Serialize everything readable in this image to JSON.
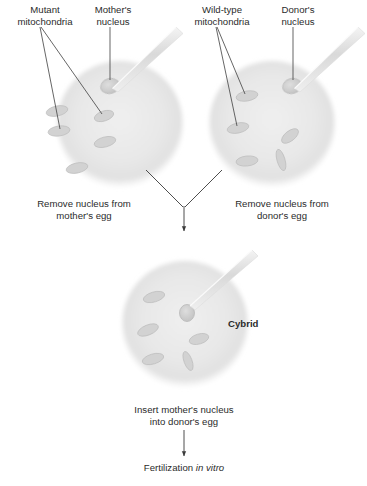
{
  "figure": {
    "background_color": "#ffffff",
    "ink_color": "#2b2b2b",
    "egg_fill": "#e9e9e9",
    "egg_edge": "#dcdcdc",
    "mitochondria_fill": "#cfcfcf",
    "mitochondria_edge": "#b4b4b4",
    "pipette_color": "#e4e4e4"
  },
  "labels": {
    "mutant_mitochondria": "Mutant\nmitochondria",
    "mutant_mitochondria_line1": "Mutant",
    "mutant_mitochondria_line2": "mitochondria",
    "mothers_nucleus_line1": "Mother's",
    "mothers_nucleus_line2": "nucleus",
    "wildtype_mitochondria_line1": "Wild-type",
    "wildtype_mitochondria_line2": "mitochondria",
    "donors_nucleus_line1": "Donor's",
    "donors_nucleus_line2": "nucleus",
    "cybrid": "Cybrid"
  },
  "captions": {
    "remove_mother_line1": "Remove nucleus from",
    "remove_mother_line2": "mother's egg",
    "remove_donor_line1": "Remove nucleus from",
    "remove_donor_line2": "donor's egg",
    "insert_line1": "Insert mother's nucleus",
    "insert_line2": "into donor's egg",
    "fertilization_prefix": "Fertilization ",
    "fertilization_italic": "in vitro"
  },
  "cells": [
    {
      "id": "mothers-egg",
      "name": "Mother's egg",
      "center": [
        120,
        124
      ],
      "radius": 63,
      "nucleus": {
        "cx": 110,
        "cy": 86,
        "rx": 9,
        "ry": 7,
        "label": "Mother's nucleus",
        "extracted_by_pipette": true
      },
      "mitochondria_type": "mutant",
      "mitochondria": [
        {
          "cx": 59,
          "cy": 131,
          "rx": 11,
          "ry": 5,
          "rot": -8
        },
        {
          "cx": 57,
          "cy": 111,
          "rx": 11,
          "ry": 5,
          "rot": -12
        },
        {
          "cx": 104,
          "cy": 116,
          "rx": 10,
          "ry": 5,
          "rot": -18
        },
        {
          "cx": 105,
          "cy": 142,
          "rx": 11,
          "ry": 5,
          "rot": -14
        },
        {
          "cx": 77,
          "cy": 168,
          "rx": 11,
          "ry": 5,
          "rot": -12
        }
      ]
    },
    {
      "id": "donors-egg",
      "name": "Donor's egg",
      "center": [
        272,
        124
      ],
      "radius": 63,
      "nucleus": {
        "cx": 292,
        "cy": 86,
        "rx": 9,
        "ry": 7,
        "label": "Donor's nucleus",
        "extracted_by_pipette": true
      },
      "mitochondria_type": "wild-type",
      "mitochondria": [
        {
          "cx": 247,
          "cy": 96,
          "rx": 11,
          "ry": 5,
          "rot": -10
        },
        {
          "cx": 238,
          "cy": 128,
          "rx": 11,
          "ry": 5,
          "rot": -12
        },
        {
          "cx": 290,
          "cy": 136,
          "rx": 10,
          "ry": 5,
          "rot": -38
        },
        {
          "cx": 247,
          "cy": 161,
          "rx": 11,
          "ry": 5,
          "rot": -6
        },
        {
          "cx": 281,
          "cy": 160,
          "rx": 4,
          "ry": 11,
          "rot": -16
        }
      ]
    },
    {
      "id": "cybrid-egg",
      "name": "Cybrid",
      "center": [
        185,
        324
      ],
      "radius": 63,
      "nucleus": {
        "cx": 187,
        "cy": 313,
        "rx": 7,
        "ry": 8,
        "label": "Inserted mother's nucleus",
        "extracted_by_pipette": false
      },
      "mitochondria_type": "wild-type",
      "mitochondria": [
        {
          "cx": 154,
          "cy": 297,
          "rx": 11,
          "ry": 5,
          "rot": -16
        },
        {
          "cx": 148,
          "cy": 330,
          "rx": 11,
          "ry": 5,
          "rot": -22
        },
        {
          "cx": 199,
          "cy": 339,
          "rx": 10,
          "ry": 5,
          "rot": -16
        },
        {
          "cx": 153,
          "cy": 359,
          "rx": 11,
          "ry": 5,
          "rot": -16
        },
        {
          "cx": 188,
          "cy": 361,
          "rx": 4,
          "ry": 10,
          "rot": -20
        }
      ]
    }
  ],
  "pipettes": [
    {
      "id": "pipette-mother",
      "tip": [
        112,
        86
      ],
      "tail": [
        178,
        28
      ]
    },
    {
      "id": "pipette-donor",
      "tip": [
        294,
        86
      ],
      "tail": [
        360,
        28
      ]
    },
    {
      "id": "pipette-cybrid",
      "tip": [
        196,
        302
      ],
      "tail": [
        258,
        250
      ]
    }
  ],
  "leader_lines": [
    {
      "id": "leader-mutant-mito-a",
      "from": [
        40,
        27
      ],
      "to": [
        60,
        130
      ]
    },
    {
      "id": "leader-mutant-mito-b",
      "from": [
        41,
        27
      ],
      "to": [
        103,
        115
      ]
    },
    {
      "id": "leader-mothers-nucleus",
      "from": [
        110,
        27
      ],
      "to": [
        110,
        81
      ]
    },
    {
      "id": "leader-wildtype-mito-a",
      "from": [
        216,
        27
      ],
      "to": [
        237,
        127
      ]
    },
    {
      "id": "leader-wildtype-mito-b",
      "from": [
        217,
        27
      ],
      "to": [
        246,
        95
      ]
    },
    {
      "id": "leader-donors-nucleus",
      "from": [
        293,
        27
      ],
      "to": [
        293,
        81
      ]
    }
  ],
  "arrows": [
    {
      "id": "arrow-merge-left",
      "from": [
        145,
        170
      ],
      "to": [
        180,
        212
      ]
    },
    {
      "id": "arrow-merge-right",
      "from": [
        223,
        170
      ],
      "to": [
        188,
        212
      ]
    },
    {
      "id": "arrow-merge-stem",
      "from": [
        184,
        206
      ],
      "to": [
        184,
        235
      ]
    },
    {
      "id": "arrow-fertilization",
      "from": [
        184,
        432
      ],
      "to": [
        184,
        458
      ]
    }
  ]
}
